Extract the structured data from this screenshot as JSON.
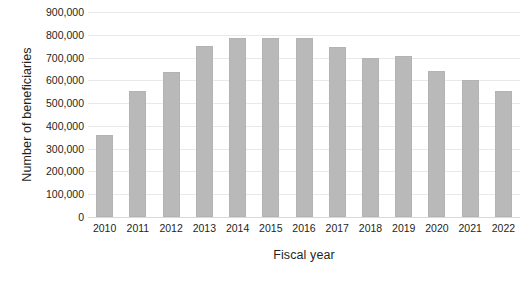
{
  "chart_data": {
    "type": "bar",
    "title": "",
    "xlabel": "Fiscal year",
    "ylabel": "Number of beneficiaries",
    "categories": [
      "2010",
      "2011",
      "2012",
      "2013",
      "2014",
      "2015",
      "2016",
      "2017",
      "2018",
      "2019",
      "2020",
      "2021",
      "2022"
    ],
    "values": [
      360000,
      555000,
      635000,
      750000,
      787000,
      786000,
      785000,
      748000,
      700000,
      706000,
      640000,
      600000,
      555000
    ],
    "series": [
      {
        "name": "Number of beneficiaries",
        "values": [
          360000,
          555000,
          635000,
          750000,
          787000,
          786000,
          785000,
          748000,
          700000,
          706000,
          640000,
          600000,
          555000
        ]
      }
    ],
    "ylim": [
      0,
      900000
    ],
    "ytick_values": [
      0,
      100000,
      200000,
      300000,
      400000,
      500000,
      600000,
      700000,
      800000,
      900000
    ],
    "ytick_labels": [
      "0",
      "100,000",
      "200,000",
      "300,000",
      "400,000",
      "500,000",
      "600,000",
      "700,000",
      "800,000",
      "900,000"
    ],
    "grid": true,
    "legend": false,
    "bar_color": "#b9b9b9",
    "gridline_color": "#e9e9e9",
    "background_color": "#ffffff"
  }
}
